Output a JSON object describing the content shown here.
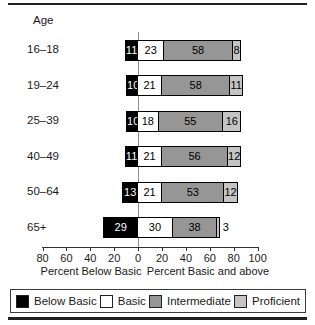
{
  "age_column_header": "Age",
  "chart_data": {
    "type": "bar",
    "orientation": "horizontal-diverging-stacked",
    "title": "",
    "categories": [
      "16–18",
      "19–24",
      "25–39",
      "40–49",
      "50–64",
      "65+"
    ],
    "series": [
      {
        "name": "Below Basic",
        "color": "#000000",
        "text_color": "#ffffff",
        "values": [
          11,
          10,
          10,
          11,
          13,
          29
        ]
      },
      {
        "name": "Basic",
        "color": "#ffffff",
        "text_color": "#000000",
        "values": [
          23,
          21,
          18,
          21,
          21,
          30
        ]
      },
      {
        "name": "Intermediate",
        "color": "#969696",
        "text_color": "#000000",
        "values": [
          58,
          58,
          55,
          56,
          53,
          38
        ]
      },
      {
        "name": "Proficient",
        "color": "#c4c4c4",
        "text_color": "#000000",
        "values": [
          8,
          11,
          16,
          12,
          12,
          3
        ]
      }
    ],
    "axis": {
      "tick_labels": [
        "80",
        "60",
        "40",
        "20",
        "0",
        "20",
        "40",
        "60",
        "80",
        "100"
      ],
      "left_title": "Percent Below Basic",
      "right_title": "Percent Basic and above",
      "left_range": [
        80,
        0
      ],
      "right_range": [
        0,
        100
      ],
      "grid": false
    },
    "legend": {
      "position": "bottom",
      "entries": [
        "Below Basic",
        "Basic",
        "Intermediate",
        "Proficient"
      ]
    }
  }
}
